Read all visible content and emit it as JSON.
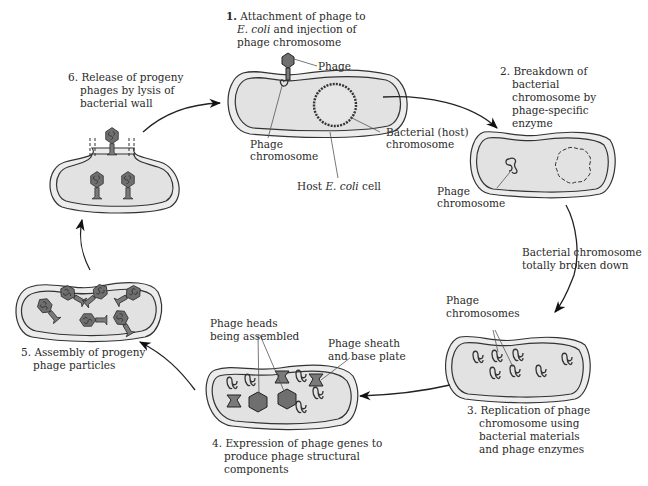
{
  "figure": {
    "steps": [
      {
        "number": "1.",
        "lines": [
          "Attachment of phage to",
          "E. coli and injection of",
          "phage chromosome"
        ]
      },
      {
        "number": "2.",
        "lines": [
          "Breakdown of",
          "bacterial",
          "chromosome by",
          "phage-specific",
          "enzyme"
        ]
      },
      {
        "number": "3.",
        "lines": [
          "Replication of phage",
          "chromosome using",
          "bacterial materials",
          "and phage enzymes"
        ]
      },
      {
        "number": "4.",
        "lines": [
          "Expression of phage genes to",
          "produce phage structural",
          "components"
        ]
      },
      {
        "number": "5.",
        "lines": [
          "Assembly of progeny",
          "phage particles"
        ]
      },
      {
        "number": "6.",
        "lines": [
          "Release of progeny",
          "phages by lysis of",
          "bacterial wall"
        ]
      }
    ],
    "labels": {
      "phage": "Phage",
      "phage_chromosome_1": [
        "Phage",
        "chromosome"
      ],
      "bacterial_host_chromosome": [
        "Bacterial (host)",
        "chromosome"
      ],
      "host_cell": "Host E. coli cell",
      "phage_chromosome_2": [
        "Phage",
        "chromosome"
      ],
      "transition_2_3": [
        "Bacterial chromosome",
        "totally broken down"
      ],
      "phage_chromosomes_3": [
        "Phage",
        "chromosomes"
      ],
      "phage_heads": [
        "Phage heads",
        "being assembled"
      ],
      "phage_sheath": [
        "Phage sheath",
        "and base plate"
      ]
    },
    "colors": {
      "cell_fill": "#e6e6e6",
      "phage_fill": "#6f6f6f",
      "outline": "#333333",
      "background": "#ffffff"
    }
  }
}
